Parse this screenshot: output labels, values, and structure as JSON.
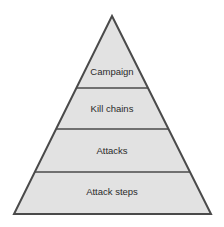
{
  "diagram": {
    "type": "pyramid",
    "colors": {
      "fill": "#e2e2e2",
      "stroke": "#4a4a4a",
      "text": "#2a2a2a",
      "background": "#ffffff"
    },
    "levels": [
      {
        "label": "Campaign"
      },
      {
        "label": "Kill chains"
      },
      {
        "label": "Attacks"
      },
      {
        "label": "Attack steps"
      }
    ]
  }
}
